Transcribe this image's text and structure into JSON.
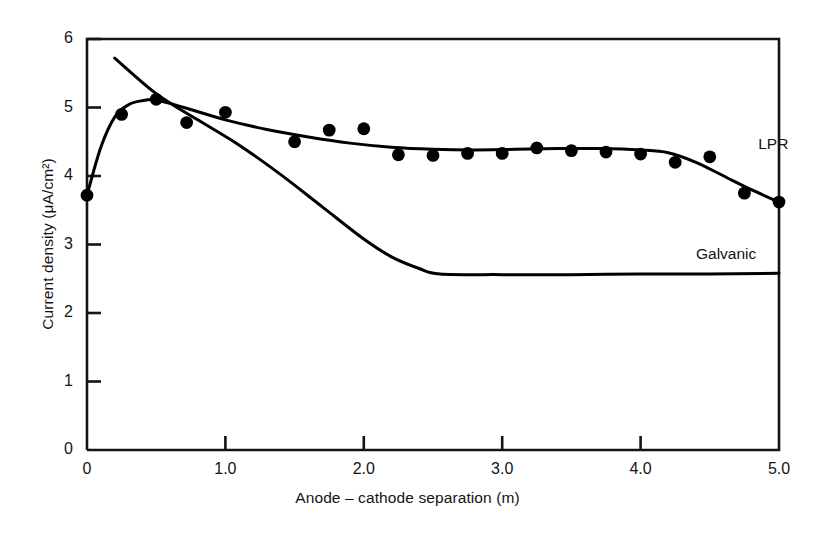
{
  "chart_data": {
    "type": "line",
    "title": "",
    "xlabel": "Anode – cathode separation (m)",
    "ylabel": "Current density (μA/cm²)",
    "xlim": [
      0,
      5.0
    ],
    "ylim": [
      0,
      6
    ],
    "xticks": [
      "0",
      "1.0",
      "2.0",
      "3.0",
      "4.0",
      "5.0"
    ],
    "xtick_values": [
      0,
      1.0,
      2.0,
      3.0,
      4.0,
      5.0
    ],
    "yticks": [
      "0",
      "1",
      "2",
      "3",
      "4",
      "5",
      "6"
    ],
    "ytick_values": [
      0,
      1,
      2,
      3,
      4,
      5,
      6
    ],
    "grid": false,
    "legend_position": "inline-right",
    "series": [
      {
        "name": "LPR",
        "style": "line-with-markers",
        "marker": "filled-circle",
        "color": "#000000",
        "x": [
          0.0,
          0.25,
          0.5,
          0.72,
          1.0,
          1.5,
          1.75,
          2.0,
          2.25,
          2.5,
          2.75,
          3.0,
          3.25,
          3.5,
          3.75,
          4.0,
          4.25,
          4.5,
          4.75,
          5.0
        ],
        "values": [
          3.72,
          4.9,
          5.12,
          4.78,
          4.93,
          4.5,
          4.67,
          4.69,
          4.31,
          4.3,
          4.33,
          4.33,
          4.41,
          4.37,
          4.35,
          4.32,
          4.2,
          4.28,
          3.75,
          3.62
        ],
        "fit_curve_x": [
          0.0,
          0.1,
          0.2,
          0.3,
          0.4,
          0.5,
          0.7,
          1.0,
          1.3,
          1.6,
          1.9,
          2.2,
          2.5,
          2.8,
          3.1,
          3.4,
          3.7,
          4.0,
          4.2,
          4.4,
          4.6,
          4.8,
          5.0
        ],
        "fit_curve_y": [
          3.72,
          4.42,
          4.86,
          5.04,
          5.1,
          5.11,
          5.0,
          4.82,
          4.68,
          4.57,
          4.48,
          4.42,
          4.39,
          4.38,
          4.39,
          4.4,
          4.4,
          4.38,
          4.34,
          4.2,
          4.0,
          3.8,
          3.62
        ]
      },
      {
        "name": "Galvanic",
        "style": "line",
        "marker": "none",
        "color": "#000000",
        "x": [
          0.2,
          0.5,
          0.8,
          1.1,
          1.4,
          1.7,
          2.0,
          2.2,
          2.4,
          2.55,
          3.0,
          3.5,
          4.0,
          4.5,
          5.0
        ],
        "values": [
          5.72,
          5.2,
          4.82,
          4.45,
          4.02,
          3.55,
          3.08,
          2.82,
          2.65,
          2.57,
          2.56,
          2.56,
          2.57,
          2.57,
          2.58
        ]
      }
    ],
    "annotations": [
      {
        "text": "LPR",
        "x": 4.85,
        "y": 4.45
      },
      {
        "text": "Galvanic",
        "x": 4.4,
        "y": 2.85
      }
    ]
  },
  "style": {
    "axis_color": "#141414",
    "line_color": "#000000",
    "marker_color": "#000000",
    "background": "#ffffff"
  }
}
